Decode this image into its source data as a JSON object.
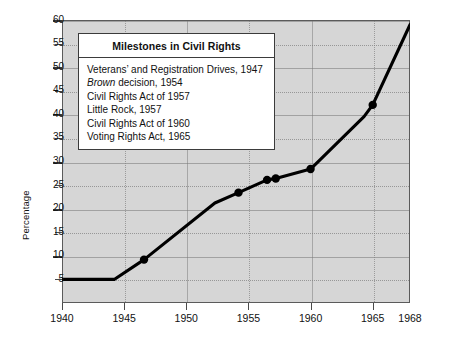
{
  "chart_data": {
    "type": "line",
    "title": "",
    "xlabel": "",
    "ylabel": "Percentage",
    "xlim": [
      1940,
      1968
    ],
    "ylim": [
      0,
      60
    ],
    "grid": true,
    "x_ticks": [
      1940,
      1945,
      1950,
      1955,
      1960,
      1965,
      1968
    ],
    "x_tick_labels": [
      "1940",
      "1945",
      "1950",
      "1955",
      "1960",
      "1965",
      "1968"
    ],
    "y_ticks": [
      5,
      10,
      15,
      20,
      25,
      30,
      35,
      40,
      45,
      50,
      55,
      60
    ],
    "y_tick_labels": [
      "5",
      "10",
      "15",
      "20",
      "25",
      "30",
      "35",
      "40",
      "45",
      "50",
      "55",
      "60"
    ],
    "series": [
      {
        "name": "Percentage",
        "color": "#000000",
        "x": [
          1940,
          1944.2,
          1946.6,
          1952.3,
          1954.2,
          1956.5,
          1957.2,
          1960.0,
          1964.3,
          1965.0,
          1968.0
        ],
        "values": [
          5.0,
          5.0,
          9.2,
          21.2,
          23.4,
          26.1,
          26.4,
          28.4,
          39.5,
          42.0,
          59.0
        ]
      }
    ],
    "markers": [
      {
        "x": 1946.6,
        "y": 9.2,
        "label": "Veterans' and Registration Drives, 1947"
      },
      {
        "x": 1954.2,
        "y": 23.4,
        "label": "Brown decision, 1954"
      },
      {
        "x": 1956.5,
        "y": 26.1,
        "label": "Civil Rights Act of 1957"
      },
      {
        "x": 1957.2,
        "y": 26.4,
        "label": "Little Rock, 1957"
      },
      {
        "x": 1960.0,
        "y": 28.4,
        "label": "Civil Rights Act of 1960"
      },
      {
        "x": 1965.0,
        "y": 42.0,
        "label": "Voting Rights Act, 1965"
      }
    ],
    "legend_position": "upper-left",
    "plot_background": "#d6d6d6",
    "line_color": "#000000"
  },
  "legend": {
    "title": "Milestones in Civil Rights",
    "items": [
      {
        "pre": "",
        "italic": "",
        "post": "Veterans’ and Registration Drives, 1947"
      },
      {
        "pre": "",
        "italic": "Brown",
        "post": " decision, 1954"
      },
      {
        "pre": "",
        "italic": "",
        "post": "Civil Rights Act of 1957"
      },
      {
        "pre": "",
        "italic": "",
        "post": "Little Rock, 1957"
      },
      {
        "pre": "",
        "italic": "",
        "post": "Civil Rights Act of 1960"
      },
      {
        "pre": "",
        "italic": "",
        "post": "Voting Rights Act, 1965"
      }
    ]
  },
  "axis": {
    "y_title": "Percentage"
  }
}
